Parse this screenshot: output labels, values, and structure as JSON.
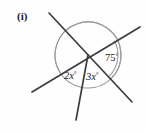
{
  "figure": {
    "part_label": "(i)",
    "background_color": "#fefefe",
    "line_color": "#3d3d3d",
    "arc_color": "#9a9a9a",
    "text_color": "#232323"
  },
  "chart_data": {
    "type": "diagram",
    "title": "(i)",
    "vertex": {
      "x": 88,
      "y": 55
    },
    "rays": [
      {
        "name": "upper-left-ray",
        "x": 49,
        "y": 13
      },
      {
        "name": "upper-right-ray",
        "x": 140,
        "y": 27
      },
      {
        "name": "lower-right-ray",
        "x": 132,
        "y": 102
      },
      {
        "name": "lower-bottom-ray",
        "x": 76,
        "y": 120
      },
      {
        "name": "lower-left-ray",
        "x": 32,
        "y": 92
      }
    ],
    "lines": [
      {
        "name": "line-1",
        "from": {
          "x": 49,
          "y": 13
        },
        "to": {
          "x": 132,
          "y": 102
        }
      },
      {
        "name": "line-2",
        "from": {
          "x": 140,
          "y": 27
        },
        "to": {
          "x": 32,
          "y": 92
        }
      },
      {
        "name": "line-3",
        "from": {
          "x": 88,
          "y": 55
        },
        "to": {
          "x": 76,
          "y": 120
        }
      }
    ],
    "angles": [
      {
        "name": "angle-75",
        "label": "75",
        "unit": "°",
        "value": 75,
        "label_x": 105,
        "label_y": 61,
        "arc_radius": 30,
        "between": [
          "upper-right-ray",
          "lower-right-ray"
        ]
      },
      {
        "name": "angle-2x",
        "label": "2x",
        "unit": "°",
        "expression": "2x",
        "label_x": 64,
        "label_y": 79,
        "arc_radius": 33,
        "between": [
          "lower-left-ray",
          "lower-bottom-ray"
        ]
      },
      {
        "name": "angle-3x",
        "label": "3x",
        "unit": "°",
        "expression": "3x",
        "label_x": 86,
        "label_y": 80,
        "arc_radius": 33,
        "between": [
          "lower-bottom-ray",
          "lower-right-ray"
        ]
      }
    ]
  }
}
